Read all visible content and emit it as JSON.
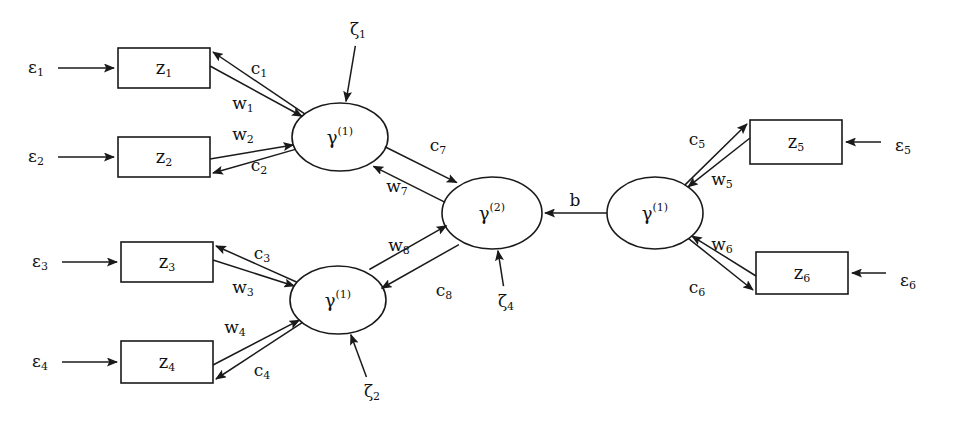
{
  "diagram": {
    "type": "path-diagram",
    "background_color": "#ffffff",
    "line_color": "#1a1a1a",
    "text_color": "#111111"
  },
  "observed_variables": [
    {
      "id": "z1",
      "base": "z",
      "sub": "1",
      "x": 164,
      "y": 68,
      "w": 92,
      "h": 40
    },
    {
      "id": "z2",
      "base": "z",
      "sub": "2",
      "x": 164,
      "y": 157,
      "w": 92,
      "h": 40
    },
    {
      "id": "z3",
      "base": "z",
      "sub": "3",
      "x": 167,
      "y": 262,
      "w": 92,
      "h": 40
    },
    {
      "id": "z4",
      "base": "z",
      "sub": "4",
      "x": 167,
      "y": 362,
      "w": 92,
      "h": 42
    },
    {
      "id": "z5",
      "base": "z",
      "sub": "5",
      "x": 796,
      "y": 142,
      "w": 92,
      "h": 44
    },
    {
      "id": "z6",
      "base": "z",
      "sub": "6",
      "x": 802,
      "y": 273,
      "w": 92,
      "h": 42
    }
  ],
  "latent_variables": [
    {
      "id": "gamma1_top",
      "base": "γ",
      "sup": "(1)",
      "x": 340,
      "y": 137,
      "rx": 48,
      "ry": 34
    },
    {
      "id": "gamma1_bottom",
      "base": "γ",
      "sup": "(1)",
      "x": 338,
      "y": 300,
      "rx": 48,
      "ry": 34
    },
    {
      "id": "gamma2_center",
      "base": "γ",
      "sup": "(2)",
      "x": 492,
      "y": 213,
      "rx": 50,
      "ry": 36
    },
    {
      "id": "gamma1_right",
      "base": "γ",
      "sup": "(1)",
      "x": 655,
      "y": 213,
      "rx": 48,
      "ry": 36
    }
  ],
  "error_terms": [
    {
      "id": "e1",
      "base": "ε",
      "sub": "1",
      "x": 36,
      "y": 68,
      "target": "z1"
    },
    {
      "id": "e2",
      "base": "ε",
      "sub": "2",
      "x": 36,
      "y": 157,
      "target": "z2"
    },
    {
      "id": "e3",
      "base": "ε",
      "sub": "3",
      "x": 40,
      "y": 262,
      "target": "z3"
    },
    {
      "id": "e4",
      "base": "ε",
      "sub": "4",
      "x": 40,
      "y": 362,
      "target": "z4"
    },
    {
      "id": "e5",
      "base": "ε",
      "sub": "5",
      "x": 903,
      "y": 146,
      "target": "z5"
    },
    {
      "id": "e6",
      "base": "ε",
      "sub": "6",
      "x": 908,
      "y": 281,
      "target": "z6"
    }
  ],
  "disturbances": [
    {
      "id": "zeta1",
      "base": "ζ",
      "sub": "1",
      "x": 358,
      "y": 30,
      "target": "gamma1_top"
    },
    {
      "id": "zeta2",
      "base": "ζ",
      "sub": "2",
      "x": 372,
      "y": 392,
      "target": "gamma1_bottom"
    },
    {
      "id": "zeta4",
      "base": "ζ",
      "sub": "4",
      "x": 506,
      "y": 302,
      "target": "gamma2_center"
    }
  ],
  "path_labels": [
    {
      "id": "c1",
      "base": "c",
      "sub": "1",
      "x": 259,
      "y": 69,
      "from": "gamma1_top",
      "to": "z1"
    },
    {
      "id": "w1",
      "base": "w",
      "sub": "1",
      "x": 243,
      "y": 104,
      "from": "z1",
      "to": "gamma1_top"
    },
    {
      "id": "w2",
      "base": "w",
      "sub": "2",
      "x": 243,
      "y": 135,
      "from": "z2",
      "to": "gamma1_top"
    },
    {
      "id": "c2",
      "base": "c",
      "sub": "2",
      "x": 259,
      "y": 166,
      "from": "gamma1_top",
      "to": "z2"
    },
    {
      "id": "c3",
      "base": "c",
      "sub": "3",
      "x": 262,
      "y": 254,
      "from": "gamma1_bottom",
      "to": "z3"
    },
    {
      "id": "w3",
      "base": "w",
      "sub": "3",
      "x": 243,
      "y": 288,
      "from": "z3",
      "to": "gamma1_bottom"
    },
    {
      "id": "w4",
      "base": "w",
      "sub": "4",
      "x": 235,
      "y": 328,
      "from": "z4",
      "to": "gamma1_bottom"
    },
    {
      "id": "c4",
      "base": "c",
      "sub": "4",
      "x": 262,
      "y": 371,
      "from": "gamma1_bottom",
      "to": "z4"
    },
    {
      "id": "c5",
      "base": "c",
      "sub": "5",
      "x": 697,
      "y": 140,
      "from": "gamma1_right",
      "to": "z5"
    },
    {
      "id": "w5",
      "base": "w",
      "sub": "5",
      "x": 722,
      "y": 180,
      "from": "z5",
      "to": "gamma1_right"
    },
    {
      "id": "w6",
      "base": "w",
      "sub": "6",
      "x": 722,
      "y": 245,
      "from": "z6",
      "to": "gamma1_right"
    },
    {
      "id": "c6",
      "base": "c",
      "sub": "6",
      "x": 697,
      "y": 288,
      "from": "gamma1_right",
      "to": "z6"
    },
    {
      "id": "c7",
      "base": "c",
      "sub": "7",
      "x": 438,
      "y": 146,
      "from": "gamma2_center",
      "to": "gamma1_top"
    },
    {
      "id": "w7",
      "base": "w",
      "sub": "7",
      "x": 397,
      "y": 187,
      "from": "gamma1_top",
      "to": "gamma2_center"
    },
    {
      "id": "w8",
      "base": "w",
      "sub": "8",
      "x": 399,
      "y": 246,
      "from": "gamma1_bottom",
      "to": "gamma2_center"
    },
    {
      "id": "c8",
      "base": "c",
      "sub": "8",
      "x": 444,
      "y": 291,
      "from": "gamma2_center",
      "to": "gamma1_bottom"
    },
    {
      "id": "b",
      "base": "b",
      "sub": "",
      "x": 575,
      "y": 201,
      "from": "gamma1_right",
      "to": "gamma2_center"
    }
  ]
}
